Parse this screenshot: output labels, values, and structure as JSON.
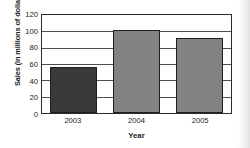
{
  "chart_data": {
    "type": "bar",
    "title": "",
    "subtitle": "",
    "xlabel": "Year",
    "ylabel": "Sales (in millions of dollars)",
    "categories": [
      "2003",
      "2004",
      "2005"
    ],
    "values": [
      56,
      102,
      92
    ],
    "series": [
      {
        "name": "Sales",
        "values": [
          56,
          102,
          92
        ]
      }
    ],
    "bar_colors": [
      "#3a3a3a",
      "#828282",
      "#828282"
    ],
    "ylim": [
      0,
      120
    ],
    "ytick_values": [
      0,
      20,
      40,
      60,
      80,
      100,
      120
    ],
    "ytick_labels": [
      "0",
      "20",
      "40",
      "60",
      "80",
      "100",
      "120"
    ],
    "xtick_labels": [
      "2003",
      "2004",
      "2005"
    ],
    "grid": true,
    "grid_axis": "y",
    "legend": false,
    "legend_position": "none",
    "annotations": [],
    "axis_color": "#2b2b2b",
    "gridline_color": "#4d4d4d",
    "background_color": "#ffffff",
    "text_color": "#1a1a1a"
  }
}
